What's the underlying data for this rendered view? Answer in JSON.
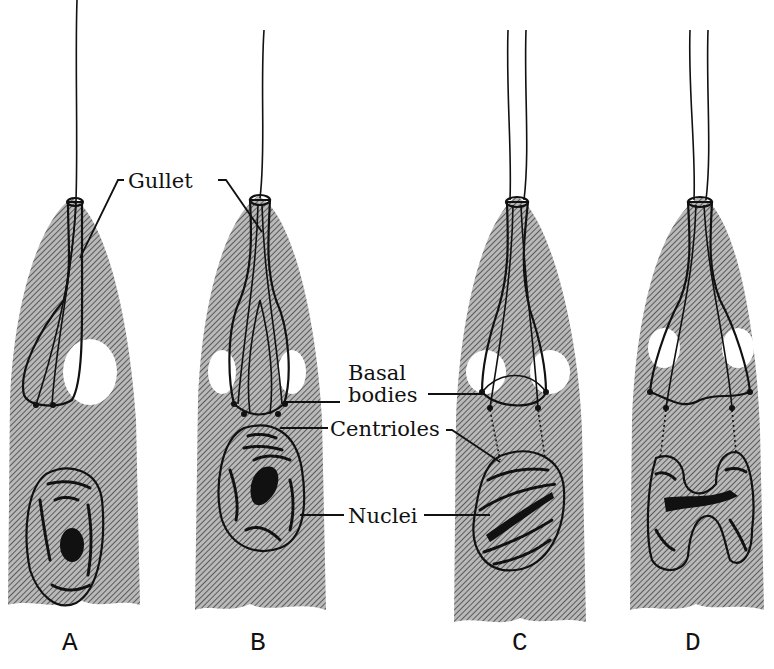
{
  "figure": {
    "type": "biological illustration",
    "colors": {
      "cell_hatch": "#8a8a8a",
      "ink": "#111111",
      "background": "#ffffff"
    }
  },
  "labels": {
    "gullet": "Gullet",
    "basal_bodies_line1": "Basal",
    "basal_bodies_line2": "bodies",
    "centrioles": "Centrioles",
    "nuclei": "Nuclei"
  },
  "panels": [
    {
      "id": "A",
      "label": "A",
      "description": "Single gullet, single nucleus with dispersed chromatin"
    },
    {
      "id": "B",
      "label": "B",
      "description": "Gullet widening, nucleus with condensing chromosomes"
    },
    {
      "id": "C",
      "label": "C",
      "description": "Gullet dividing at base, nucleus elongating with spindle fibres to centrioles"
    },
    {
      "id": "D",
      "label": "D",
      "description": "Gullet split, nucleus dumbbell-shaped dividing into two"
    }
  ]
}
